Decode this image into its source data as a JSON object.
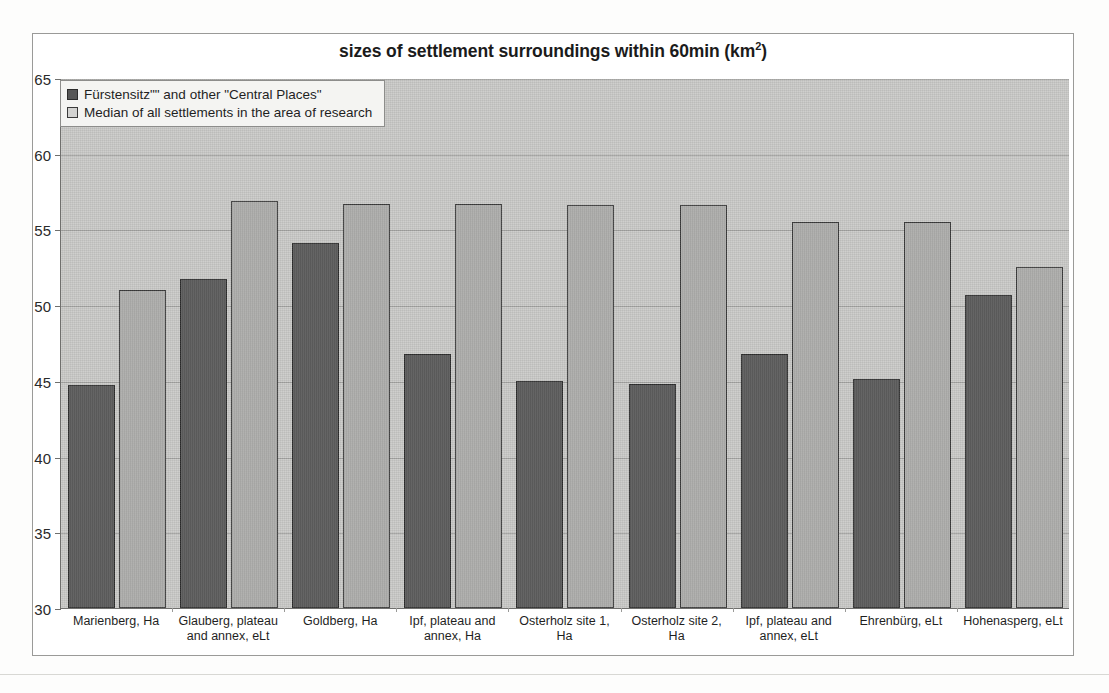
{
  "chart_data": {
    "type": "bar",
    "title_main": "sizes of settlement surroundings within 60min (km",
    "title_sup": "2",
    "title_tail": ")",
    "xlabel": "",
    "ylabel": "",
    "ylim": [
      30,
      65
    ],
    "yticks": [
      30,
      35,
      40,
      45,
      50,
      55,
      60,
      65
    ],
    "grid": true,
    "legend_position": "top-left",
    "categories": [
      "Marienberg, Ha",
      "Glauberg, plateau and annex, eLt",
      "Goldberg, Ha",
      "Ipf, plateau and annex, Ha",
      "Osterholz site 1, Ha",
      "Osterholz site 2, Ha",
      "Ipf, plateau and annex, eLt",
      "Ehrenbürg, eLt",
      "Hohenasperg, eLt"
    ],
    "categories_lines": [
      [
        "Marienberg, Ha"
      ],
      [
        "Glauberg, plateau",
        "and annex, eLt"
      ],
      [
        "Goldberg, Ha"
      ],
      [
        "Ipf, plateau and",
        "annex, Ha"
      ],
      [
        "Osterholz site 1,",
        "Ha"
      ],
      [
        "Osterholz site 2,",
        "Ha"
      ],
      [
        "Ipf, plateau and",
        "annex, eLt"
      ],
      [
        "Ehrenbürg, eLt"
      ],
      [
        "Hohenasperg, eLt"
      ]
    ],
    "series": [
      {
        "name": "Fürstensitz\"\" and other \"Central Places\"",
        "color": "#575757",
        "values": [
          44.7,
          51.7,
          54.1,
          46.8,
          45.0,
          44.8,
          46.8,
          45.1,
          50.7
        ]
      },
      {
        "name": "Median of all settlements in the area of research",
        "color": "#aeaeac",
        "values": [
          51.0,
          56.9,
          56.7,
          56.7,
          56.6,
          56.6,
          55.5,
          55.5,
          52.5
        ]
      }
    ]
  }
}
